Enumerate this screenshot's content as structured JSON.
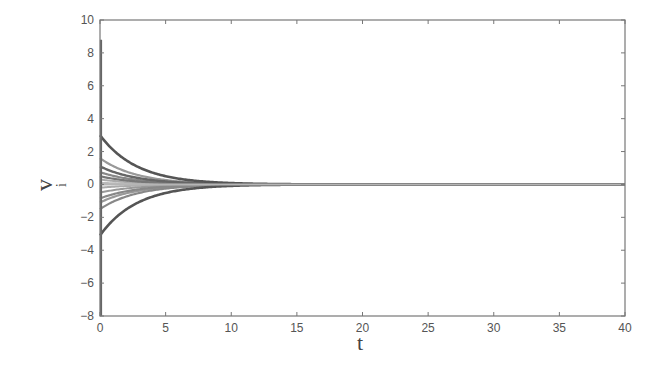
{
  "chart_data": {
    "type": "line",
    "title": "",
    "xlabel": "t",
    "ylabel": "v",
    "ylabel_subscript": "i",
    "xlim": [
      0,
      40
    ],
    "ylim": [
      -8,
      10
    ],
    "xticks": [
      0,
      5,
      10,
      15,
      20,
      25,
      30,
      35,
      40
    ],
    "yticks": [
      -8,
      -6,
      -4,
      -2,
      0,
      2,
      4,
      6,
      8,
      10
    ],
    "grid": false,
    "legend": null,
    "decay_time_constant": 2.8,
    "initial_spike": {
      "t": 0,
      "ymax": 8.8,
      "ymin": -8.0
    },
    "series": [
      {
        "name": "v1",
        "v0": 3.0,
        "color": "#555555",
        "width": 2.6
      },
      {
        "name": "v2",
        "v0": 1.6,
        "color": "#999999",
        "width": 2.2
      },
      {
        "name": "v3",
        "v0": 1.1,
        "color": "#666666",
        "width": 2.4
      },
      {
        "name": "v4",
        "v0": 0.75,
        "color": "#888888",
        "width": 2.2
      },
      {
        "name": "v5",
        "v0": 0.5,
        "color": "#777777",
        "width": 2.2
      },
      {
        "name": "v6",
        "v0": 0.3,
        "color": "#aaaaaa",
        "width": 2.0
      },
      {
        "name": "v7",
        "v0": 0.1,
        "color": "#bbbbbb",
        "width": 2.0
      },
      {
        "name": "v8",
        "v0": -0.2,
        "color": "#aaaaaa",
        "width": 2.0
      },
      {
        "name": "v9",
        "v0": -0.5,
        "color": "#999999",
        "width": 2.0
      },
      {
        "name": "v10",
        "v0": -0.85,
        "color": "#888888",
        "width": 2.2
      },
      {
        "name": "v11",
        "v0": -1.1,
        "color": "#999999",
        "width": 2.2
      },
      {
        "name": "v12",
        "v0": -1.5,
        "color": "#888888",
        "width": 2.2
      },
      {
        "name": "v13",
        "v0": -3.1,
        "color": "#555555",
        "width": 2.6
      }
    ],
    "x": "t from 0 to 40; v_i(t) = v0 * exp(-t/2.8), converging to 0"
  }
}
